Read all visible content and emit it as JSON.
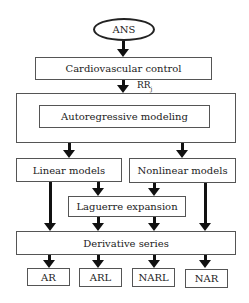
{
  "diagram": {
    "nodes": {
      "ans": "ANS",
      "cardio": "Cardiovascular control",
      "rr_label": "RR",
      "rr_sub": "j",
      "autoreg": "Autoregressive modeling",
      "linear": "Linear models",
      "nonlinear": "Nonlinear models",
      "laguerre": "Laguerre expansion",
      "derivative": "Derivative series",
      "outputs": [
        "AR",
        "ARL",
        "NARL",
        "NAR"
      ]
    },
    "edges": [
      [
        "ANS",
        "Cardiovascular control"
      ],
      [
        "Cardiovascular control",
        "Autoregressive modeling",
        "RRj"
      ],
      [
        "Autoregressive modeling",
        "Linear models"
      ],
      [
        "Autoregressive modeling",
        "Nonlinear models"
      ],
      [
        "Linear models",
        "Laguerre expansion"
      ],
      [
        "Nonlinear models",
        "Laguerre expansion"
      ],
      [
        "Linear models",
        "Derivative series"
      ],
      [
        "Nonlinear models",
        "Derivative series"
      ],
      [
        "Laguerre expansion",
        "Derivative series"
      ],
      [
        "Derivative series",
        "AR"
      ],
      [
        "Derivative series",
        "ARL"
      ],
      [
        "Derivative series",
        "NARL"
      ],
      [
        "Derivative series",
        "NAR"
      ]
    ]
  }
}
